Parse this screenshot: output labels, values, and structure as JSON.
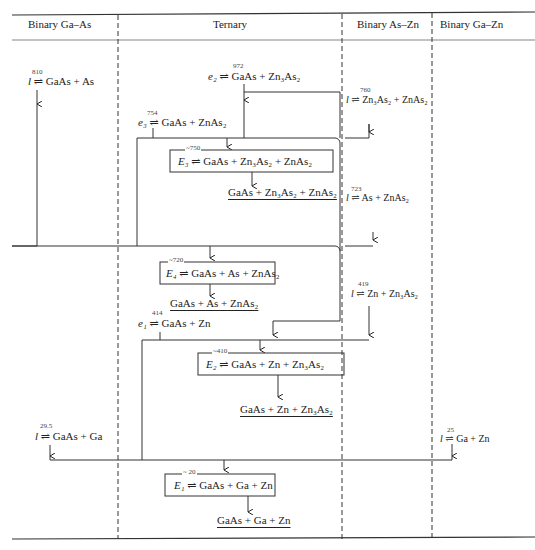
{
  "columns": [
    {
      "label": "Binary Ga–As"
    },
    {
      "label": "Ternary"
    },
    {
      "label": "Binary As–Zn"
    },
    {
      "label": "Binary Ga–Zn"
    }
  ],
  "reactions": {
    "ga_as_l": {
      "temp": "810",
      "sym": "l",
      "text": " ⇌ GaAs + As"
    },
    "e2": {
      "temp": "972",
      "sym": "e₂",
      "text": " ⇌ GaAs + Zn₃As₂"
    },
    "as_zn_760": {
      "temp": "760",
      "sym": "l",
      "text": " ⇌ Zn₃As₂ + ZnAs₂"
    },
    "e3": {
      "temp": "754",
      "sym": "e₃",
      "text": " ⇌ GaAs + ZnAs₂"
    },
    "E3": {
      "temp": "~750",
      "sym": "E₃",
      "text": " ⇌ GaAs + Zn₃As₂ + ZnAs₂",
      "product": "GaAs + Zn₃As₂ + ZnAs₂"
    },
    "as_zn_723": {
      "temp": "723",
      "sym": "l",
      "text": " ⇌ As + ZnAs₂"
    },
    "E4": {
      "temp": "~720",
      "sym": "E₄",
      "text": " ⇌ GaAs + As + ZnAs₂",
      "product": "GaAs + As + ZnAs₂"
    },
    "as_zn_419": {
      "temp": "419",
      "sym": "l",
      "text": " ⇌ Zn + Zn₃As₂"
    },
    "e1": {
      "temp": "414",
      "sym": "e₁",
      "text": " ⇌ GaAs + Zn"
    },
    "E2": {
      "temp": "~410",
      "sym": "E₂",
      "text": " ⇌ GaAs + Zn + Zn₃As₂",
      "product": "GaAs + Zn + Zn₃As₂"
    },
    "ga_as_29": {
      "temp": "29.5",
      "sym": "l",
      "text": " ⇌ GaAs + Ga"
    },
    "ga_zn_25": {
      "temp": "25",
      "sym": "l",
      "text": " ⇌ Ga + Zn"
    },
    "E1": {
      "temp": "~ 20",
      "sym": "E₁",
      "text": " ⇌ GaAs + Ga + Zn",
      "product": "GaAs + Ga + Zn"
    }
  }
}
